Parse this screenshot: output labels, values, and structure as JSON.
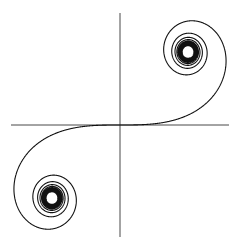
{
  "figure": {
    "width": 240,
    "height": 247,
    "background": "#ffffff",
    "stroke_color": "#111111",
    "axis_color": "#333333"
  },
  "axes": {
    "origin": [
      120,
      125
    ],
    "x_axis": {
      "from": 11,
      "to": 229
    },
    "y_axis": {
      "from": 13,
      "to": 237
    }
  },
  "curve": {
    "type": "euler-spiral",
    "parametric": "x = C(t), y = S(t) (Fresnel integrals)",
    "t_range": [
      -7.5,
      7.5
    ],
    "scale_x": 136,
    "scale_y": 146,
    "limit_points": [
      [
        0.5,
        0.5
      ],
      [
        -0.5,
        -0.5
      ]
    ],
    "limit_points_px": [
      [
        188,
        52
      ],
      [
        52,
        198
      ]
    ]
  }
}
